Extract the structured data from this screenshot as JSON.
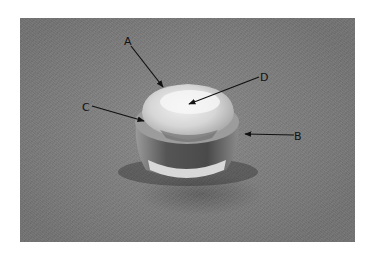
{
  "figure": {
    "labels": [
      {
        "id": "A",
        "text": "A",
        "pos": [
          128,
          44
        ],
        "tip": [
          163,
          87
        ]
      },
      {
        "id": "B",
        "text": "B",
        "pos": [
          296,
          140
        ],
        "tip": [
          244,
          134
        ]
      },
      {
        "id": "C",
        "text": "C",
        "pos": [
          84,
          110
        ],
        "tip": [
          144,
          121
        ]
      },
      {
        "id": "D",
        "text": "D",
        "pos": [
          264,
          81
        ],
        "tip": [
          188,
          104
        ]
      }
    ],
    "colors": {
      "background": "#ffffff",
      "photo_base": "#7e7e7e",
      "label": "#111111"
    }
  }
}
